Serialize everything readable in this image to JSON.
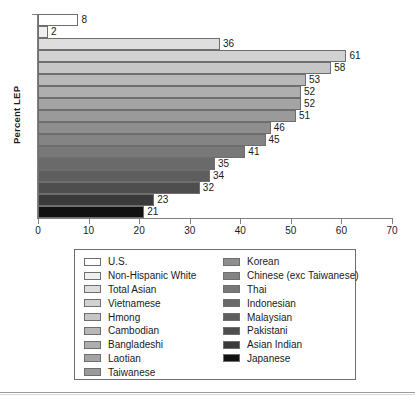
{
  "chart_data": {
    "type": "bar",
    "orientation": "horizontal",
    "title": "",
    "xlabel": "",
    "ylabel": "Percent LEP",
    "xlim": [
      0,
      70
    ],
    "xticks": [
      0,
      10,
      20,
      30,
      40,
      50,
      60,
      70
    ],
    "grid": false,
    "legend_position": "below",
    "categories": [
      "U.S.",
      "Non-Hispanic White",
      "Total Asian",
      "Vietnamese",
      "Hmong",
      "Cambodian",
      "Bangladeshi",
      "Laotian",
      "Taiwanese",
      "Korean",
      "Chinese (exc Taiwanese)",
      "Thai",
      "Indonesian",
      "Malaysian",
      "Pakistani",
      "Asian Indian",
      "Japanese"
    ],
    "values": [
      8,
      2,
      36,
      61,
      58,
      53,
      52,
      52,
      51,
      46,
      45,
      41,
      35,
      34,
      32,
      23,
      21
    ],
    "data_labels": [
      "8",
      "2",
      "36",
      "61",
      "58",
      "53",
      "52",
      "52",
      "51",
      "46",
      "45",
      "41",
      "35",
      "34",
      "32",
      "23",
      "21"
    ],
    "colors": [
      "#ffffff",
      "#efefef",
      "#dedede",
      "#d2d2d2",
      "#c6c6c6",
      "#b8b8b8",
      "#aeaeae",
      "#a4a4a4",
      "#9a9a9a",
      "#8e8e8e",
      "#848484",
      "#787878",
      "#6a6a6a",
      "#5e5e5e",
      "#4e4e4e",
      "#3a3a3a",
      "#111111"
    ]
  },
  "legend": {
    "left_column": [
      {
        "label": "U.S.",
        "color": "#ffffff"
      },
      {
        "label": "Non-Hispanic White",
        "color": "#efefef"
      },
      {
        "label": "Total Asian",
        "color": "#dedede"
      },
      {
        "label": "Vietnamese",
        "color": "#d2d2d2"
      },
      {
        "label": "Hmong",
        "color": "#c6c6c6"
      },
      {
        "label": "Cambodian",
        "color": "#b8b8b8"
      },
      {
        "label": "Bangladeshi",
        "color": "#aeaeae"
      },
      {
        "label": "Laotian",
        "color": "#a4a4a4"
      },
      {
        "label": "Taiwanese",
        "color": "#9a9a9a"
      }
    ],
    "right_column": [
      {
        "label": "Korean",
        "color": "#8e8e8e"
      },
      {
        "label": "Chinese (exc Taiwanese)",
        "color": "#848484"
      },
      {
        "label": "Thai",
        "color": "#787878"
      },
      {
        "label": "Indonesian",
        "color": "#6a6a6a"
      },
      {
        "label": "Malaysian",
        "color": "#5e5e5e"
      },
      {
        "label": "Pakistani",
        "color": "#4e4e4e"
      },
      {
        "label": "Asian Indian",
        "color": "#3a3a3a"
      },
      {
        "label": "Japanese",
        "color": "#111111"
      }
    ]
  }
}
